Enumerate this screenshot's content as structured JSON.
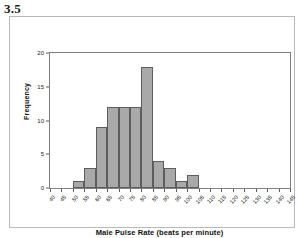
{
  "exercise": {
    "number": "3.5"
  },
  "chart_data": {
    "type": "bar",
    "title": "",
    "xlabel": "Male Pulse Rate (beats per minute)",
    "ylabel": "Frequency",
    "xlim": [
      40,
      145
    ],
    "ylim": [
      0,
      20
    ],
    "bin_width": 5,
    "grid": false,
    "legend": null,
    "x_tick_labels": [
      "40",
      "45",
      "50",
      "55",
      "60",
      "65",
      "70",
      "75",
      "80",
      "85",
      "90",
      "95",
      "100",
      "105",
      "110",
      "115",
      "120",
      "125",
      "130",
      "135",
      "140",
      "145"
    ],
    "y_tick_labels": [
      "0",
      "5",
      "10",
      "15",
      "20"
    ],
    "y_ticks": [
      0,
      5,
      10,
      15,
      20
    ],
    "bins": [
      {
        "start": 40,
        "end": 45,
        "label": "40-45",
        "value": 0
      },
      {
        "start": 45,
        "end": 50,
        "label": "45-50",
        "value": 0
      },
      {
        "start": 50,
        "end": 55,
        "label": "50-55",
        "value": 1
      },
      {
        "start": 55,
        "end": 60,
        "label": "55-60",
        "value": 3
      },
      {
        "start": 60,
        "end": 65,
        "label": "60-65",
        "value": 9
      },
      {
        "start": 65,
        "end": 70,
        "label": "65-70",
        "value": 12
      },
      {
        "start": 70,
        "end": 75,
        "label": "70-75",
        "value": 12
      },
      {
        "start": 75,
        "end": 80,
        "label": "75-80",
        "value": 12
      },
      {
        "start": 80,
        "end": 85,
        "label": "80-85",
        "value": 18
      },
      {
        "start": 85,
        "end": 90,
        "label": "85-90",
        "value": 4
      },
      {
        "start": 90,
        "end": 95,
        "label": "90-95",
        "value": 3
      },
      {
        "start": 95,
        "end": 100,
        "label": "95-100",
        "value": 1
      },
      {
        "start": 100,
        "end": 105,
        "label": "100-105",
        "value": 2
      },
      {
        "start": 105,
        "end": 110,
        "label": "105-110",
        "value": 0
      },
      {
        "start": 110,
        "end": 115,
        "label": "110-115",
        "value": 0
      },
      {
        "start": 115,
        "end": 120,
        "label": "115-120",
        "value": 0
      },
      {
        "start": 120,
        "end": 125,
        "label": "120-125",
        "value": 0
      },
      {
        "start": 125,
        "end": 130,
        "label": "125-130",
        "value": 0
      },
      {
        "start": 130,
        "end": 135,
        "label": "130-135",
        "value": 0
      },
      {
        "start": 135,
        "end": 140,
        "label": "135-140",
        "value": 0
      },
      {
        "start": 140,
        "end": 145,
        "label": "140-145",
        "value": 0
      }
    ],
    "colors": {
      "bar_fill": "#a9a9a9",
      "bar_border": "#5d5d5d",
      "axis": "#808080",
      "text": "#1b1b1b",
      "frame": "#b9b9b9",
      "background": "#ffffff"
    }
  }
}
